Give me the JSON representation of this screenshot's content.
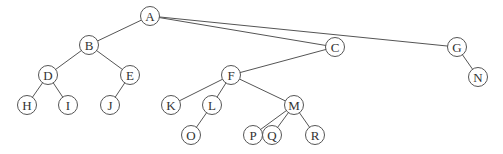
{
  "diagram": {
    "type": "tree",
    "node_radius": 9.5,
    "colors": {
      "line": "#555555",
      "fill": "#ffffff",
      "text": "#333333"
    },
    "nodes": [
      {
        "id": "A",
        "label": "A",
        "x": 150,
        "y": 16
      },
      {
        "id": "B",
        "label": "B",
        "x": 89,
        "y": 45
      },
      {
        "id": "C",
        "label": "C",
        "x": 335,
        "y": 47
      },
      {
        "id": "G",
        "label": "G",
        "x": 457,
        "y": 47
      },
      {
        "id": "D",
        "label": "D",
        "x": 48,
        "y": 75
      },
      {
        "id": "E",
        "label": "E",
        "x": 130,
        "y": 75
      },
      {
        "id": "F",
        "label": "F",
        "x": 231,
        "y": 75
      },
      {
        "id": "N",
        "label": "N",
        "x": 478,
        "y": 77
      },
      {
        "id": "H",
        "label": "H",
        "x": 27,
        "y": 105
      },
      {
        "id": "I",
        "label": "I",
        "x": 68,
        "y": 105
      },
      {
        "id": "J",
        "label": "J",
        "x": 110,
        "y": 105
      },
      {
        "id": "K",
        "label": "K",
        "x": 171,
        "y": 105
      },
      {
        "id": "L",
        "label": "L",
        "x": 212,
        "y": 105
      },
      {
        "id": "M",
        "label": "M",
        "x": 294,
        "y": 105
      },
      {
        "id": "O",
        "label": "O",
        "x": 191,
        "y": 135
      },
      {
        "id": "P",
        "label": "P",
        "x": 253,
        "y": 135
      },
      {
        "id": "Q",
        "label": "Q",
        "x": 272,
        "y": 135
      },
      {
        "id": "R",
        "label": "R",
        "x": 315,
        "y": 135
      }
    ],
    "edges": [
      [
        "A",
        "B"
      ],
      [
        "A",
        "C"
      ],
      [
        "A",
        "G"
      ],
      [
        "B",
        "D"
      ],
      [
        "B",
        "E"
      ],
      [
        "D",
        "H"
      ],
      [
        "D",
        "I"
      ],
      [
        "E",
        "J"
      ],
      [
        "C",
        "F"
      ],
      [
        "G",
        "N"
      ],
      [
        "F",
        "K"
      ],
      [
        "F",
        "L"
      ],
      [
        "F",
        "M"
      ],
      [
        "L",
        "O"
      ],
      [
        "M",
        "P"
      ],
      [
        "M",
        "Q"
      ],
      [
        "M",
        "R"
      ]
    ]
  }
}
